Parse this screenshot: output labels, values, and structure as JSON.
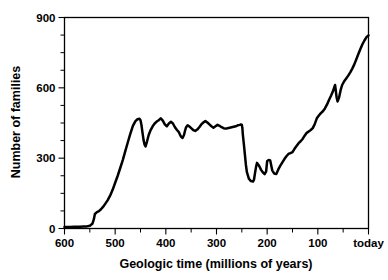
{
  "chart_data": {
    "type": "line",
    "title": "",
    "subtitle": "",
    "xlabel": "Geologic time (millions of years)",
    "ylabel": "Number of families",
    "xlim": [
      600,
      0
    ],
    "ylim": [
      0,
      900
    ],
    "x_axis_reversed": true,
    "grid": false,
    "legend": null,
    "legend_position": "none",
    "x_tick_labels": [
      "600",
      "500",
      "400",
      "300",
      "200",
      "100",
      "today"
    ],
    "x_tick_values": [
      600,
      500,
      400,
      300,
      200,
      100,
      0
    ],
    "x_minor_tick_interval": 50,
    "y_tick_labels": [
      "0",
      "300",
      "600",
      "900"
    ],
    "y_tick_values": [
      0,
      300,
      600,
      900
    ],
    "y_minor_tick_interval": 75,
    "series": [
      {
        "name": "Number of families",
        "color": "#000000",
        "x": [
          600,
          590,
          580,
          570,
          562,
          556,
          550,
          545,
          542,
          540,
          536,
          532,
          528,
          524,
          520,
          515,
          510,
          505,
          500,
          495,
          490,
          485,
          480,
          475,
          470,
          465,
          460,
          456,
          452,
          450,
          448,
          446,
          444,
          442,
          440,
          437,
          434,
          430,
          426,
          422,
          418,
          414,
          410,
          406,
          402,
          398,
          394,
          390,
          386,
          382,
          378,
          374,
          372,
          370,
          367,
          364,
          362,
          360,
          357,
          354,
          350,
          346,
          342,
          338,
          334,
          330,
          326,
          322,
          318,
          314,
          310,
          306,
          302,
          298,
          294,
          290,
          286,
          282,
          278,
          274,
          270,
          266,
          262,
          258,
          254,
          252,
          250,
          249,
          248,
          246,
          244,
          242,
          240,
          236,
          232,
          228,
          226,
          224,
          222,
          220,
          216,
          212,
          208,
          205,
          202,
          200,
          197,
          194,
          190,
          186,
          182,
          178,
          174,
          170,
          166,
          162,
          158,
          154,
          150,
          146,
          142,
          138,
          134,
          130,
          126,
          122,
          118,
          114,
          110,
          106,
          102,
          98,
          94,
          90,
          86,
          82,
          78,
          74,
          70,
          68,
          66,
          65,
          63,
          61,
          58,
          55,
          52,
          48,
          44,
          40,
          36,
          32,
          28,
          24,
          20,
          16,
          12,
          8,
          4,
          0
        ],
        "y": [
          6,
          6,
          7,
          7,
          8,
          9,
          12,
          20,
          40,
          62,
          70,
          74,
          82,
          92,
          104,
          120,
          140,
          165,
          195,
          225,
          258,
          292,
          330,
          368,
          405,
          438,
          458,
          466,
          468,
          462,
          440,
          408,
          378,
          358,
          350,
          372,
          398,
          420,
          436,
          448,
          456,
          462,
          470,
          460,
          444,
          436,
          448,
          455,
          448,
          432,
          420,
          410,
          400,
          392,
          386,
          400,
          418,
          432,
          440,
          436,
          428,
          420,
          416,
          422,
          432,
          444,
          452,
          458,
          452,
          444,
          436,
          430,
          436,
          442,
          438,
          432,
          428,
          426,
          428,
          430,
          432,
          434,
          436,
          440,
          442,
          444,
          442,
          430,
          400,
          360,
          316,
          272,
          240,
          212,
          202,
          200,
          208,
          236,
          262,
          280,
          268,
          250,
          238,
          232,
          244,
          288,
          292,
          290,
          248,
          234,
          232,
          252,
          268,
          282,
          296,
          308,
          318,
          322,
          326,
          340,
          352,
          364,
          372,
          382,
          396,
          408,
          414,
          420,
          428,
          446,
          470,
          482,
          492,
          500,
          512,
          528,
          548,
          566,
          586,
          600,
          612,
          596,
          560,
          542,
          560,
          590,
          612,
          628,
          640,
          652,
          666,
          682,
          700,
          722,
          744,
          766,
          786,
          802,
          816,
          824
        ]
      }
    ]
  },
  "axis": {
    "y_label": "Number of families",
    "x_label": "Geologic time (millions of years)"
  }
}
